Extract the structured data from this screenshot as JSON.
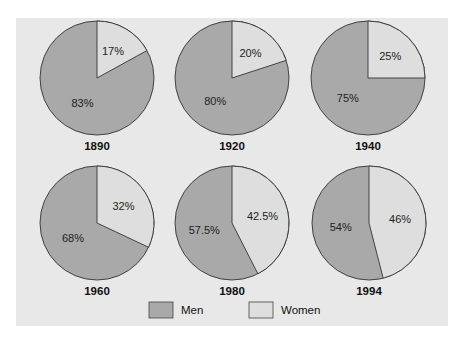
{
  "chart_data": {
    "type": "pie",
    "title": "",
    "colors": {
      "men": "#a9a9a9",
      "women": "#dedede",
      "background": "#e8e8e8",
      "stroke": "#333333"
    },
    "legend": [
      {
        "name": "Men",
        "color": "#a9a9a9"
      },
      {
        "name": "Women",
        "color": "#dedede"
      }
    ],
    "legend_position": "bottom",
    "charts": [
      {
        "year": "1890",
        "men": 83,
        "women": 17,
        "men_label": "83%",
        "women_label": "17%"
      },
      {
        "year": "1920",
        "men": 80,
        "women": 20,
        "men_label": "80%",
        "women_label": "20%"
      },
      {
        "year": "1940",
        "men": 75,
        "women": 25,
        "men_label": "75%",
        "women_label": "25%"
      },
      {
        "year": "1960",
        "men": 68,
        "women": 32,
        "men_label": "68%",
        "women_label": "32%"
      },
      {
        "year": "1980",
        "men": 57.5,
        "women": 42.5,
        "men_label": "57.5%",
        "women_label": "42.5%"
      },
      {
        "year": "1994",
        "men": 54,
        "women": 46,
        "men_label": "54%",
        "women_label": "46%"
      }
    ]
  }
}
